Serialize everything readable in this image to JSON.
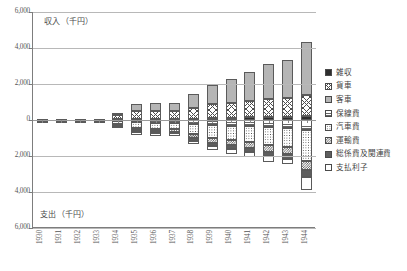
{
  "chart_data": {
    "type": "bar",
    "subtype": "diverging-stacked-bar",
    "title": "",
    "xlabel": "",
    "ylabel_top": "収入（千円）",
    "ylabel_bottom": "支出（千円）",
    "ylim": [
      -6000,
      6000
    ],
    "ytick_labels": [
      "6,000",
      "4,000",
      "2,000",
      "0",
      "2,000",
      "4,000",
      "6,000"
    ],
    "ytick_values": [
      6000,
      4000,
      2000,
      0,
      -2000,
      -4000,
      -6000
    ],
    "grid": true,
    "legend_position": "right",
    "categories": [
      "1930",
      "1931",
      "1932",
      "1933",
      "1934",
      "1935",
      "1936",
      "1937",
      "1938",
      "1939",
      "1940",
      "1941",
      "1942",
      "1943",
      "1944"
    ],
    "series": [
      {
        "name": "雑収",
        "direction": "up",
        "pattern": "solid-black",
        "values": [
          12,
          14,
          15,
          17,
          30,
          45,
          55,
          60,
          70,
          110,
          130,
          150,
          170,
          190,
          230
        ]
      },
      {
        "name": "貨車",
        "direction": "up",
        "pattern": "crosshatch",
        "values": [
          30,
          32,
          35,
          40,
          230,
          430,
          440,
          445,
          620,
          760,
          830,
          900,
          980,
          1010,
          1180
        ]
      },
      {
        "name": "客車",
        "direction": "up",
        "pattern": "fine-grid",
        "values": [
          18,
          20,
          22,
          25,
          140,
          425,
          445,
          455,
          770,
          1100,
          1320,
          1620,
          1960,
          2130,
          2900
        ]
      },
      {
        "name": "保線費",
        "direction": "down",
        "pattern": "horizontal-lines",
        "values": [
          -8,
          -9,
          -10,
          -11,
          -60,
          -130,
          -140,
          -150,
          -240,
          -300,
          -330,
          -360,
          -400,
          -420,
          -560
        ]
      },
      {
        "name": "汽車費",
        "direction": "down",
        "pattern": "dots",
        "values": [
          -14,
          -15,
          -17,
          -19,
          -150,
          -330,
          -350,
          -360,
          -560,
          -700,
          -800,
          -880,
          -1000,
          -1080,
          -1700
        ]
      },
      {
        "name": "運輸費",
        "direction": "down",
        "pattern": "checker",
        "values": [
          -7,
          -8,
          -9,
          -10,
          -60,
          -120,
          -130,
          -135,
          -200,
          -250,
          -280,
          -320,
          -360,
          -380,
          -520
        ]
      },
      {
        "name": "総係費及関連費",
        "direction": "down",
        "pattern": "dark-gray",
        "values": [
          -5,
          -6,
          -7,
          -8,
          -40,
          -90,
          -95,
          -100,
          -150,
          -190,
          -210,
          -230,
          -260,
          -280,
          -380
        ]
      },
      {
        "name": "支払利子",
        "direction": "down",
        "pattern": "white",
        "values": [
          -4,
          -5,
          -5,
          -6,
          -110,
          -160,
          -165,
          -170,
          -210,
          -230,
          -250,
          -270,
          -290,
          -300,
          -740
        ]
      }
    ]
  },
  "legend": {
    "items": [
      {
        "label": "雑収",
        "pattern": "solid-black"
      },
      {
        "label": "貨車",
        "pattern": "crosshatch"
      },
      {
        "label": "客車",
        "pattern": "fine-grid"
      },
      {
        "label": "保線費",
        "pattern": "horizontal-lines"
      },
      {
        "label": "汽車費",
        "pattern": "dots"
      },
      {
        "label": "運輸費",
        "pattern": "checker"
      },
      {
        "label": "総係費及関連費",
        "pattern": "dark-gray"
      },
      {
        "label": "支払利子",
        "pattern": "white"
      }
    ]
  }
}
